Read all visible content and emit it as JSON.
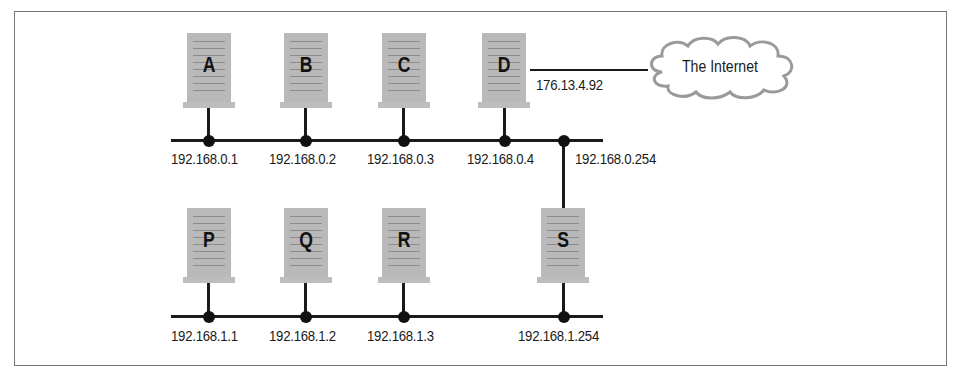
{
  "diagram": {
    "type": "network-topology",
    "networks": [
      {
        "name": "upper-lan",
        "subnet": "192.168.0.x"
      },
      {
        "name": "lower-lan",
        "subnet": "192.168.1.x"
      }
    ],
    "upper_hosts": [
      {
        "label": "A",
        "ip": "192.168.0.1"
      },
      {
        "label": "B",
        "ip": "192.168.0.2"
      },
      {
        "label": "C",
        "ip": "192.168.0.3"
      },
      {
        "label": "D",
        "ip": "192.168.0.4",
        "external_ip": "176.13.4.92"
      }
    ],
    "lower_hosts": [
      {
        "label": "P",
        "ip": "192.168.1.1"
      },
      {
        "label": "Q",
        "ip": "192.168.1.2"
      },
      {
        "label": "R",
        "ip": "192.168.1.3"
      },
      {
        "label": "S",
        "ip": "192.168.1.254",
        "upper_ip": "192.168.0.254"
      }
    ],
    "cloud": {
      "label": "The Internet"
    }
  }
}
